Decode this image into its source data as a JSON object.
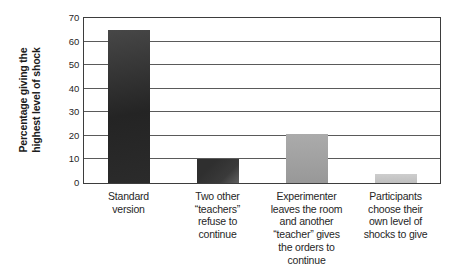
{
  "chart_data": {
    "type": "bar",
    "title": "",
    "xlabel": "",
    "ylabel": "Percentage giving the\nhighest level of shock",
    "ylim": [
      0,
      70
    ],
    "yticks": [
      0,
      10,
      20,
      30,
      40,
      50,
      60,
      70
    ],
    "grid": "horizontal",
    "legend": "none",
    "categories": [
      "Standard\nversion",
      "Two other\n“teachers”\nrefuse to\ncontinue",
      "Experimenter\nleaves the room\nand another\n“teacher” gives\nthe orders to\ncontinue",
      "Participants\nchoose their\nown level of\nshocks to give"
    ],
    "values": [
      65,
      10,
      21,
      4
    ],
    "bar_fills": [
      "linear-gradient(170deg, #474747 0%, #242424 55%, #2b2b2b 100%)",
      "linear-gradient(135deg, #2f2f2f 30%, #3a3a3a 70%, #606060 100%)",
      "linear-gradient(180deg, #ababab 0%, #989898 100%)",
      "linear-gradient(180deg, #cdcdcd 0%, #bfbfbf 100%)"
    ],
    "axis_color": "#3d3d3d",
    "grid_color": "#5a5a5a",
    "text_color": "#262626",
    "background": "#ffffff"
  }
}
